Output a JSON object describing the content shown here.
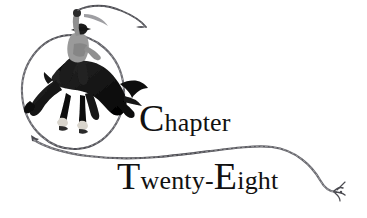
{
  "page": {
    "width": 367,
    "height": 218,
    "background_color": "#ffffff",
    "kind": "book-chapter-heading-illustration"
  },
  "heading": {
    "line1": {
      "full_text": "Chapter",
      "initial_cap": "C",
      "remainder": "hapter"
    },
    "line2": {
      "full_text": "Twenty-Eight",
      "initial_cap": "T",
      "part1_remainder": "wenty",
      "hyphen": "-",
      "second_cap": "E",
      "part2_remainder": "ight"
    },
    "text_color": "#111111"
  },
  "illustration": {
    "title": "cowboy riding bucking bronco inside lasso loop",
    "elements": [
      {
        "name": "lasso-loop",
        "description": "large oval rope loop encircling horse and rider"
      },
      {
        "name": "bucking-horse",
        "description": "dark bucking bronco, head down, hind legs kicking up"
      },
      {
        "name": "cowboy-rider",
        "description": "rider in light shirt with hat, one arm raised holding rope"
      },
      {
        "name": "raised-rope",
        "description": "rope trailing up and to the right from raised hand"
      },
      {
        "name": "rope-sweep",
        "description": "long rope sweeping right across the page between the two heading lines"
      },
      {
        "name": "rope-frayed-tip",
        "description": "frayed knotted rope end at lower right"
      }
    ],
    "ink_color": "#1a1a1a",
    "rope_color": "#55555a",
    "rider_shirt_color": "#9a9a9a",
    "hoof_highlight_color": "#d8d4cc"
  }
}
